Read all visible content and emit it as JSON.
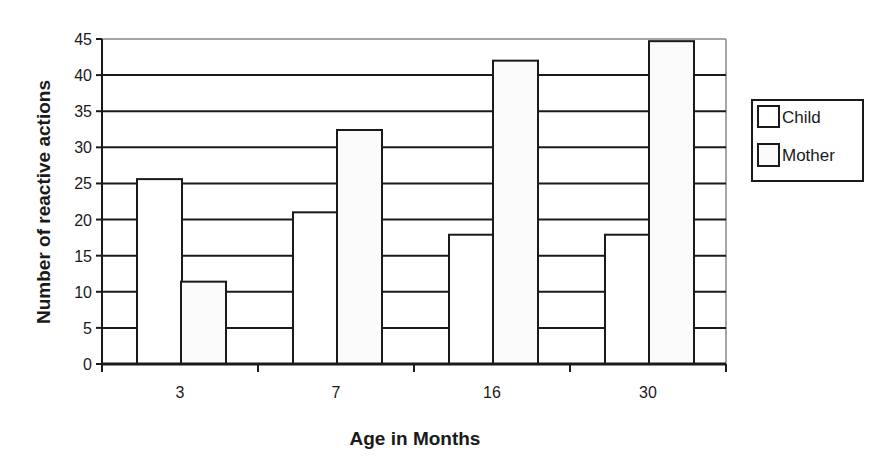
{
  "chart_data": {
    "type": "bar",
    "title": "",
    "xlabel": "Age in Months",
    "ylabel": "Number of reactive actions",
    "categories": [
      "3",
      "7",
      "16",
      "30"
    ],
    "series": [
      {
        "name": "Child",
        "values": [
          25.6,
          21.0,
          17.9,
          17.9
        ],
        "fill": "#ffffff"
      },
      {
        "name": "Mother",
        "values": [
          11.4,
          32.4,
          42.0,
          44.7
        ],
        "fill": "#fbfbfb"
      }
    ],
    "ylim": [
      0,
      45
    ],
    "yticks": [
      0,
      5,
      10,
      15,
      20,
      25,
      30,
      35,
      40,
      45
    ],
    "grid": true,
    "gridlines_behind_bars_only": true,
    "legend_position": "right",
    "colors": {
      "stroke": "#1a1a1a",
      "background": "#ffffff"
    }
  },
  "legend": {
    "items": [
      {
        "label": "Child"
      },
      {
        "label": "Mother"
      }
    ]
  },
  "axes": {
    "x_title": "Age in Months",
    "y_title": "Number of reactive actions"
  }
}
